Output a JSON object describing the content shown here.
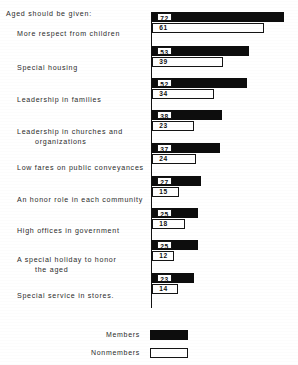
{
  "chart_data": {
    "type": "bar",
    "orientation": "horizontal",
    "title": "Aged should be given:",
    "xlabel": "",
    "ylabel": "",
    "xlim": [
      0,
      76
    ],
    "grid": false,
    "legend_position": "bottom-center",
    "categories": [
      "More respect from children",
      "Special housing",
      "Leadership in families",
      "Leadership in churches and organizations",
      "Low fares on public conveyances",
      "An honor role in each community",
      "High offices in government",
      "A special holiday to honor the aged",
      "Special service in stores."
    ],
    "series": [
      {
        "name": "Members",
        "values": [
          72,
          53,
          52,
          38,
          37,
          27,
          25,
          25,
          23
        ]
      },
      {
        "name": "Nonmembers",
        "values": [
          61,
          39,
          34,
          23,
          24,
          15,
          18,
          12,
          14
        ]
      }
    ]
  },
  "heading": "Aged should be given:",
  "category_lines": [
    [
      "More respect from children"
    ],
    [
      "Special housing"
    ],
    [
      "Leadership in families"
    ],
    [
      "Leadership in churches and",
      "organizations"
    ],
    [
      "Low fares on public conveyances"
    ],
    [
      "An honor role in each community"
    ],
    [
      "High offices in government"
    ],
    [
      "A special holiday to honor",
      "the aged"
    ],
    [
      "Special service in stores."
    ]
  ],
  "legend": {
    "members_label": "Members",
    "nonmembers_label": "Nonmembers"
  },
  "colors": {
    "members_fill": "#0d0d0d",
    "nonmembers_fill": "#ffffff",
    "stroke": "#141414",
    "background": "#ffffff",
    "text": "#2b2b2b"
  }
}
